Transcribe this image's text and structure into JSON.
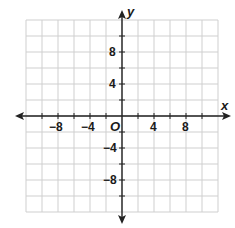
{
  "figure": {
    "type": "coordinate-plane",
    "x_axis_label": "x",
    "y_axis_label": "y",
    "origin_label": "O",
    "x_range": [
      -12,
      12
    ],
    "y_range": [
      -12,
      12
    ],
    "grid_step": 2,
    "x_tick_labels": [
      "−8",
      "−4",
      "4",
      "8"
    ],
    "x_tick_values": [
      -8,
      -4,
      4,
      8
    ],
    "y_tick_labels": [
      "8",
      "4",
      "−4",
      "−8"
    ],
    "y_tick_values": [
      8,
      4,
      -4,
      -8
    ],
    "grid_color": "#cfcfcf",
    "axis_color": "#222222"
  }
}
